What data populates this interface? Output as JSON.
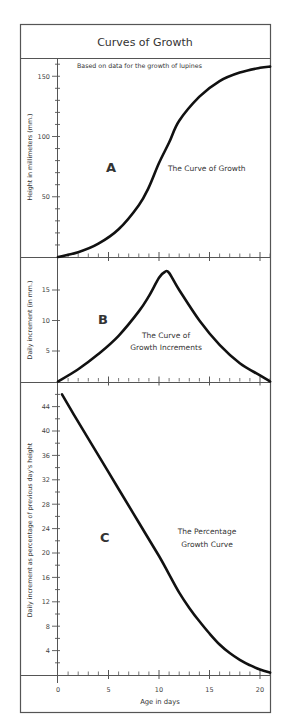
{
  "title": "Curves of Growth",
  "colors": {
    "frame": "#555555",
    "curve": "#111111",
    "text": "#333333",
    "background": "#ffffff"
  },
  "chart_data": [
    {
      "id": "A",
      "type": "line",
      "panel_letter": "A",
      "subtitle": "Based on data for the growth of lupines",
      "annotation": "The Curve of Growth",
      "xlabel": "Age in days",
      "ylabel": "Height in millimeters (mm.)",
      "xlim": [
        0,
        21
      ],
      "ylim": [
        0,
        160
      ],
      "yticks": [
        50,
        100,
        150
      ],
      "x": [
        0,
        2,
        4,
        6,
        8,
        9,
        10,
        11,
        12,
        14,
        16,
        18,
        20,
        21
      ],
      "y": [
        0,
        4,
        11,
        23,
        43,
        58,
        78,
        95,
        113,
        133,
        146,
        153,
        157,
        158
      ]
    },
    {
      "id": "B",
      "type": "line",
      "panel_letter": "B",
      "annotation": [
        "The Curve of",
        "Growth Increments"
      ],
      "xlabel": "Age in days",
      "ylabel": "Daily increment (in mm.)",
      "xlim": [
        0,
        21
      ],
      "ylim": [
        0,
        19
      ],
      "yticks": [
        5,
        10,
        15
      ],
      "x": [
        0,
        2,
        4,
        6,
        8,
        9,
        10,
        10.6,
        11,
        12,
        14,
        16,
        18,
        20,
        21
      ],
      "y": [
        0,
        2,
        4.5,
        7.5,
        11.5,
        14,
        17,
        18,
        17.8,
        15,
        10,
        6,
        3,
        1,
        0
      ]
    },
    {
      "id": "C",
      "type": "line",
      "panel_letter": "C",
      "annotation": [
        "The Percentage",
        "Growth Curve"
      ],
      "xlabel": "Age in days",
      "ylabel": "Daily increment as percentage of previous day's height",
      "xlim": [
        0,
        21
      ],
      "ylim": [
        0,
        48
      ],
      "xticks": [
        0,
        5,
        10,
        15,
        20
      ],
      "yticks": [
        4,
        8,
        12,
        16,
        20,
        24,
        28,
        32,
        36,
        40,
        44
      ],
      "x": [
        0.4,
        2,
        4,
        6,
        8,
        10,
        11,
        12,
        13,
        14,
        15,
        16,
        17,
        18,
        19,
        20,
        21
      ],
      "y": [
        46,
        41.5,
        36,
        30.5,
        25,
        19.5,
        16.5,
        13.5,
        11,
        8.8,
        6.8,
        5,
        3.6,
        2.5,
        1.6,
        0.9,
        0.4
      ]
    }
  ]
}
